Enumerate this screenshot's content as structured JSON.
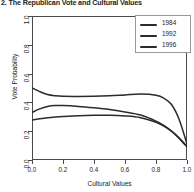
{
  "figure": {
    "title": "2. The Republican Vote and Cultural Values",
    "background_color": "#ffffff",
    "frame_color": "#4a4a4a"
  },
  "legend": {
    "position": "top-right",
    "entries": [
      {
        "label": "1984",
        "color": "#2b2b2b"
      },
      {
        "label": "1992",
        "color": "#2b2b2b"
      },
      {
        "label": "1996",
        "color": "#2b2b2b"
      }
    ]
  },
  "axes": {
    "x": {
      "label": "Cultural Values",
      "ticks": [
        "0.0",
        "0.2",
        "0.4",
        "0.6",
        "0.8",
        "1.0"
      ],
      "range": [
        0.0,
        1.0
      ]
    },
    "y": {
      "label": "Vote Probability",
      "ticks": [
        "0.0",
        "0.2",
        "0.4",
        "0.6",
        "0.8",
        "1.0"
      ],
      "range": [
        0.0,
        1.0
      ]
    }
  },
  "chart_data": {
    "type": "line",
    "title": "2. The Republican Vote and Cultural Values",
    "xlabel": "Cultural Values",
    "ylabel": "Vote Probability",
    "xlim": [
      0.0,
      1.0
    ],
    "ylim": [
      0.0,
      1.0
    ],
    "grid": false,
    "legend_position": "top-right",
    "x": [
      0.0,
      0.05,
      0.1,
      0.15,
      0.2,
      0.3,
      0.4,
      0.5,
      0.6,
      0.7,
      0.8,
      0.85,
      0.9,
      0.95,
      1.0
    ],
    "series": [
      {
        "name": "1984",
        "color": "#2b2b2b",
        "values": [
          0.5,
          0.475,
          0.455,
          0.446,
          0.442,
          0.441,
          0.442,
          0.446,
          0.452,
          0.458,
          0.45,
          0.43,
          0.385,
          0.28,
          0.11
        ]
      },
      {
        "name": "1992",
        "color": "#2b2b2b",
        "values": [
          0.33,
          0.355,
          0.372,
          0.378,
          0.378,
          0.372,
          0.362,
          0.35,
          0.334,
          0.312,
          0.27,
          0.24,
          0.2,
          0.15,
          0.09
        ]
      },
      {
        "name": "1996",
        "color": "#2b2b2b",
        "values": [
          0.278,
          0.286,
          0.293,
          0.298,
          0.302,
          0.308,
          0.311,
          0.311,
          0.306,
          0.294,
          0.262,
          0.236,
          0.2,
          0.152,
          0.095
        ]
      }
    ]
  }
}
